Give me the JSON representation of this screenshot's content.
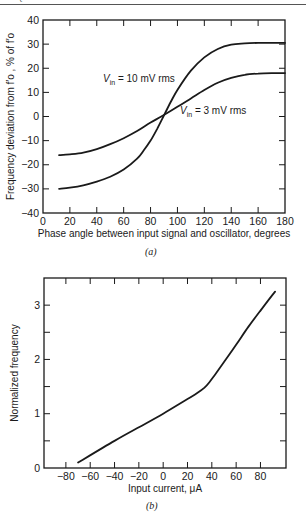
{
  "header": {
    "text": "FREQUENCY SYNTHESIZERS"
  },
  "chart_data": [
    {
      "id": "a",
      "type": "line",
      "caption": "(a)",
      "title": "",
      "xlabel": "Phase angle between input signal and oscillator, degrees",
      "ylabel": "Frequency deviation from f′o , % of f′o",
      "xlim": [
        0,
        180
      ],
      "ylim": [
        -40,
        40
      ],
      "xticks": [
        0,
        20,
        40,
        60,
        80,
        100,
        120,
        140,
        160,
        180
      ],
      "yticks": [
        -40,
        -30,
        -20,
        -10,
        0,
        10,
        20,
        30,
        40
      ],
      "grid": false,
      "series": [
        {
          "name": "Vin = 10 mV rms",
          "label_main": "V",
          "label_sub": "in",
          "label_rest": " = 10 mV rms",
          "x": [
            12,
            20,
            30,
            40,
            50,
            60,
            70,
            75,
            80,
            85,
            90,
            95,
            100,
            110,
            120,
            130,
            140,
            150,
            160,
            170,
            180
          ],
          "y": [
            -30,
            -29.5,
            -28.5,
            -27,
            -25,
            -22,
            -17.5,
            -14,
            -10,
            -5,
            0.5,
            6,
            11,
            19,
            24.5,
            28,
            29.8,
            30.3,
            30.5,
            30.5,
            30.5
          ]
        },
        {
          "name": "Vin = 3 mV rms",
          "label_main": "V",
          "label_sub": "in",
          "label_rest": " = 3 mV rms",
          "x": [
            12,
            20,
            30,
            40,
            50,
            60,
            70,
            80,
            88,
            100,
            110,
            120,
            130,
            140,
            150,
            160,
            170,
            180
          ],
          "y": [
            -16,
            -15.7,
            -15,
            -13.5,
            -11.5,
            -9,
            -6,
            -2.5,
            0,
            4,
            7.5,
            11,
            14,
            16,
            17.3,
            17.8,
            18,
            18
          ]
        }
      ]
    },
    {
      "id": "b",
      "type": "line",
      "caption": "(b)",
      "title": "",
      "xlabel": "Input current, μA",
      "ylabel": "Normalized frequency",
      "xlim": [
        -98,
        101
      ],
      "ylim": [
        0,
        3.5
      ],
      "xticks": [
        -80,
        -60,
        -40,
        -20,
        0,
        20,
        40,
        60,
        80
      ],
      "yticks": [
        0,
        1,
        2,
        3
      ],
      "grid": false,
      "series": [
        {
          "name": "Normalized frequency vs input current",
          "x": [
            -70,
            -40,
            -20,
            0,
            20,
            28,
            34,
            38,
            42,
            50,
            60,
            70,
            80,
            92
          ],
          "y": [
            0.1,
            0.5,
            0.75,
            1.0,
            1.27,
            1.38,
            1.48,
            1.58,
            1.7,
            1.95,
            2.27,
            2.6,
            2.9,
            3.25
          ]
        }
      ]
    }
  ]
}
